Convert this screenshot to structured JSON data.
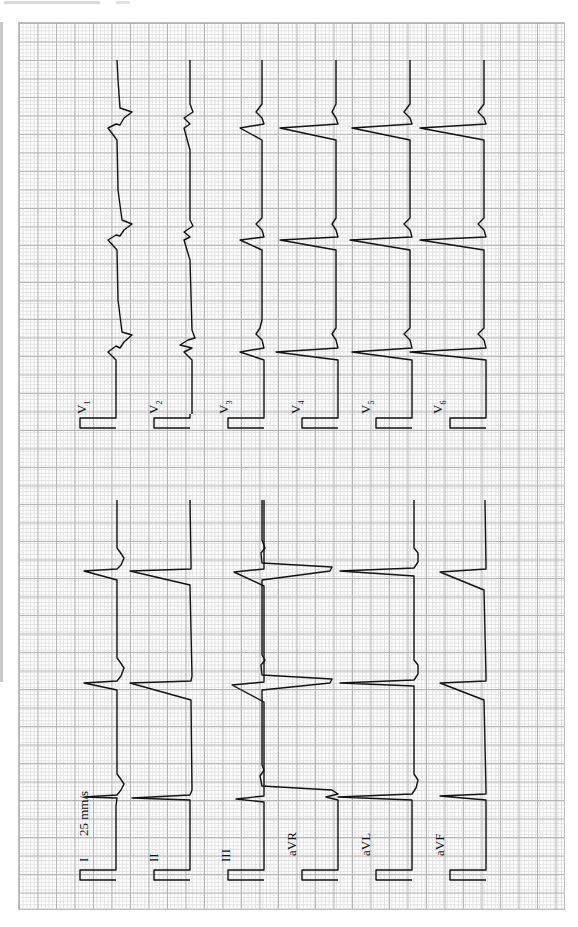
{
  "paper": {
    "grid_color_major": "#b4b4b4",
    "grid_color_minor": "#e0e0e0",
    "trace_color": "#111111",
    "orientation": "rotated-90-ccw"
  },
  "speed_label": "25 mm/s",
  "limb_leads": [
    {
      "label": "I"
    },
    {
      "label": "II"
    },
    {
      "label": "III"
    },
    {
      "label": "aVR"
    },
    {
      "label": "aVL"
    },
    {
      "label": "aVF"
    }
  ],
  "chest_leads": [
    {
      "label": "V",
      "sub": "1"
    },
    {
      "label": "V",
      "sub": "2"
    },
    {
      "label": "V",
      "sub": "3"
    },
    {
      "label": "V",
      "sub": "4"
    },
    {
      "label": "V",
      "sub": "5"
    },
    {
      "label": "V",
      "sub": "6"
    }
  ]
}
